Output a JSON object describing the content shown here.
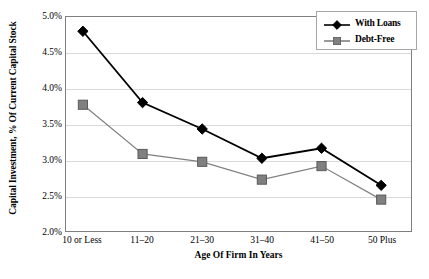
{
  "chart_data": {
    "type": "line",
    "title": "",
    "xlabel": "Age Of Firm In Years",
    "ylabel": "Capital Investment, % Of Current Capital Stock",
    "categories": [
      "10 or Less",
      "11–20",
      "21–30",
      "31–40",
      "41–50",
      "50 Plus"
    ],
    "ylim": [
      2.0,
      5.0
    ],
    "ytick_step": 0.5,
    "ytick_labels": [
      "5.0%",
      "4.5%",
      "4.0%",
      "3.5%",
      "3.0%",
      "2.5%",
      "2.0%"
    ],
    "ytick_values": [
      5.0,
      4.5,
      4.0,
      3.5,
      3.0,
      2.5,
      2.0
    ],
    "grid": true,
    "legend_position": "top-right",
    "series": [
      {
        "name": "With Loans",
        "marker": "diamond",
        "color": "#000000",
        "values": [
          4.8,
          3.8,
          3.43,
          3.02,
          3.16,
          2.64
        ]
      },
      {
        "name": "Debt-Free",
        "marker": "square",
        "color": "#808080",
        "values": [
          3.77,
          3.08,
          2.97,
          2.72,
          2.91,
          2.44
        ]
      }
    ]
  },
  "colors": {
    "series_with_loans": "#000000",
    "series_debt_free": "#808080",
    "gridline": "#d9d9d9",
    "plot_border": "#7f7f7f",
    "legend_border": "#a6a6a6",
    "background": "#ffffff"
  }
}
